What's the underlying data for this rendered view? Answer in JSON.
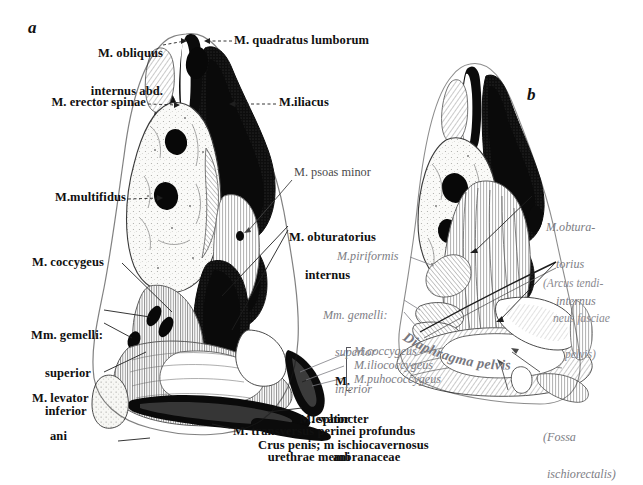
{
  "plate": {
    "background": "#ffffff",
    "ink_dark": "#101010",
    "ink_mid": "#4a4a4a",
    "ink_gray": "#7d7d84",
    "figure_letters": [
      {
        "id": "a",
        "text": "a"
      },
      {
        "id": "b",
        "text": "b"
      }
    ]
  },
  "figure_a": {
    "letter": "a",
    "labels": [
      {
        "id": "obliquus-internus",
        "line1": "M. obliquus",
        "line2": "internus abd."
      },
      {
        "id": "quadratus-lumborum",
        "text": "M. quadratus lumborum"
      },
      {
        "id": "erector-spinae",
        "text": "M. erector spinae"
      },
      {
        "id": "iliacus",
        "text": "M.iliacus"
      },
      {
        "id": "psoas-minor",
        "text": "M. psoas minor"
      },
      {
        "id": "multifidus",
        "text": "M.multifidus"
      },
      {
        "id": "obturatorius-internus",
        "line1": "M. obturatorius",
        "line2": "internus"
      },
      {
        "id": "coccygeus",
        "text": "M. coccygeus"
      },
      {
        "id": "gemelli",
        "line1": "Mm. gemelli:",
        "line2": "superior",
        "line3": "inferior"
      },
      {
        "id": "levator-ani-left",
        "line1": "M. levator",
        "line2": "ani"
      },
      {
        "id": "levator-ani-right",
        "line1": "M.",
        "line2": "levator",
        "line3": "ani"
      },
      {
        "id": "sphincter-urethrae",
        "line1": "M. sphincter",
        "line2": "urethrae membranaceae"
      },
      {
        "id": "transversus-perinei",
        "text": "M. transversus perinei profundus"
      },
      {
        "id": "crus-penis",
        "text": "Crus penis; m ischiocavernosus"
      }
    ],
    "bracket_labels": [
      {
        "id": "coccygeus-b",
        "text": "M.coccygeus"
      },
      {
        "id": "iliococcygeus",
        "text": "M.iliococcygeus"
      },
      {
        "id": "pubococcygeus",
        "text": "M.puhococcygeus"
      }
    ]
  },
  "figure_b": {
    "letter": "b",
    "labels": [
      {
        "id": "obturatorius-internus-b",
        "line1": "M.obtura-",
        "line2": "torius",
        "line3": "internus"
      },
      {
        "id": "arcus-tendineus",
        "line1": "(Arcus tendi-",
        "line2": "neus fasciae",
        "line3": "pelvis)"
      },
      {
        "id": "piriformis",
        "text": "M.piriformis"
      },
      {
        "id": "gemelli-b",
        "line1": "Mm. gemelli:",
        "line2": "superior",
        "line3": "inferior"
      },
      {
        "id": "diaphragma-pelvis",
        "text": "Diaphragma pelvis"
      },
      {
        "id": "fossa-ischiorectalis",
        "line1": "(Fossa",
        "line2": "ischiorectalis)"
      }
    ]
  }
}
